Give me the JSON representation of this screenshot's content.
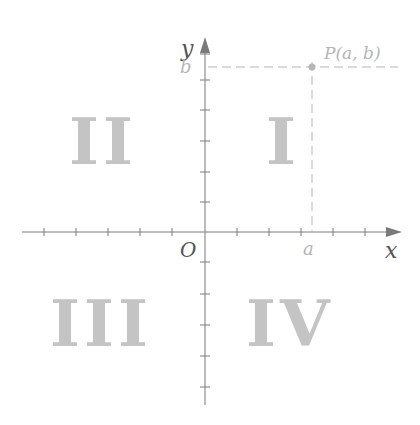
{
  "diagram": {
    "axes": {
      "x_label": "x",
      "y_label": "y",
      "origin_label": "O",
      "color": "#7a7a7a"
    },
    "point": {
      "label": "P(a, b)",
      "x_label": "a",
      "y_label": "b",
      "color": "#b5b5b5"
    },
    "quadrants": [
      {
        "id": "I",
        "label": "I"
      },
      {
        "id": "II",
        "label": "II"
      },
      {
        "id": "III",
        "label": "III"
      },
      {
        "id": "IV",
        "label": "IV"
      }
    ],
    "quadrant_color": "#c4c4c4"
  }
}
